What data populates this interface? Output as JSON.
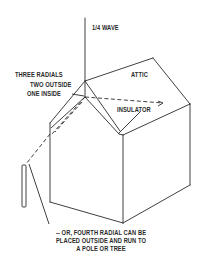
{
  "diagram": {
    "type": "antenna installation sketch",
    "labels": {
      "wave": "1/4 WAVE",
      "attic": "ATTIC",
      "three_radials": "THREE RADIALS",
      "two_outside": "TWO OUTSIDE",
      "one_inside": "ONE INSIDE",
      "insulator": "INSULATOR",
      "note_line1": "-- OR, FOURTH RADIAL CAN BE",
      "note_line2": "PLACED OUTSIDE AND RUN TO",
      "note_line3": "A POLE OR TREE"
    },
    "colors": {
      "line": "#2a2a2a",
      "background": "#ffffff"
    }
  }
}
